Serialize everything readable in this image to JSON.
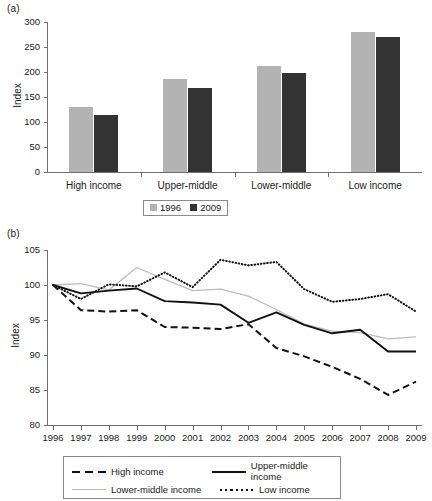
{
  "figure": {
    "panel_a_label": "(a)",
    "panel_b_label": "(b)"
  },
  "chart_data": [
    {
      "type": "bar",
      "panel": "(a)",
      "title": "",
      "xlabel": "",
      "ylabel": "Index",
      "ylim": [
        0,
        300
      ],
      "yticks": [
        0,
        50,
        100,
        150,
        200,
        250,
        300
      ],
      "grid": false,
      "legend_position": "bottom",
      "categories": [
        "High income",
        "Upper-middle",
        "Lower-middle",
        "Low income"
      ],
      "series": [
        {
          "name": "1996",
          "color": "#b3b3b3",
          "values": [
            130,
            186,
            212,
            280
          ]
        },
        {
          "name": "2009",
          "color": "#333333",
          "values": [
            114,
            169,
            199,
            270
          ]
        }
      ]
    },
    {
      "type": "line",
      "panel": "(b)",
      "title": "",
      "xlabel": "",
      "ylabel": "Index",
      "ylim": [
        80,
        105
      ],
      "yticks": [
        80,
        85,
        90,
        95,
        100,
        105
      ],
      "grid": false,
      "legend_position": "bottom",
      "x": [
        1996,
        1997,
        1998,
        1999,
        2000,
        2001,
        2002,
        2003,
        2004,
        2005,
        2006,
        2007,
        2008,
        2009
      ],
      "series": [
        {
          "name": "High income",
          "style": "dashed",
          "color": "#111111",
          "values": [
            100.0,
            96.4,
            96.2,
            96.4,
            94.0,
            93.9,
            93.7,
            94.4,
            91.0,
            89.8,
            88.3,
            86.6,
            84.3,
            86.2
          ]
        },
        {
          "name": "Upper-middle income",
          "style": "solid",
          "color": "#111111",
          "values": [
            100.0,
            98.8,
            99.2,
            99.5,
            97.7,
            97.5,
            97.2,
            94.6,
            96.1,
            94.3,
            93.1,
            93.6,
            90.5,
            90.5
          ]
        },
        {
          "name": "Lower-middle income",
          "style": "light-solid",
          "color": "#bdbdbd",
          "values": [
            100.0,
            100.2,
            99.3,
            102.5,
            100.8,
            99.2,
            99.4,
            98.4,
            96.5,
            94.4,
            93.4,
            93.2,
            92.3,
            92.6
          ]
        },
        {
          "name": "Low income",
          "style": "dotted",
          "color": "#111111",
          "values": [
            100.0,
            98.0,
            100.1,
            99.8,
            101.8,
            99.7,
            103.6,
            102.8,
            103.3,
            99.4,
            97.6,
            98.0,
            98.7,
            96.2
          ]
        }
      ]
    }
  ]
}
